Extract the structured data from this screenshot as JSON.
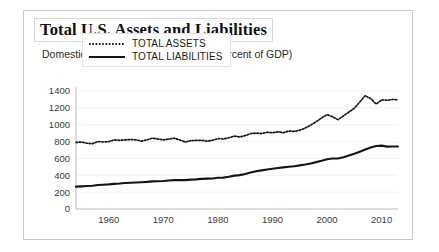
{
  "figure": {
    "title": "Total U.S. Assets and Liabilities",
    "subtitle": "Domestic Assets and Liabilities (as a Percent of GDP)",
    "border_color": "#c9c9c9",
    "background": "#ffffff"
  },
  "legend": {
    "position": "top-left-inside",
    "entries": [
      {
        "label": "TOTAL ASSETS",
        "style": "dotted",
        "color": "#141414"
      },
      {
        "label": "TOTAL LIABILITIES",
        "style": "solid",
        "color": "#141414"
      }
    ]
  },
  "chart_data": {
    "type": "line",
    "title": "Total U.S. Assets and Liabilities",
    "subtitle": "Domestic Assets and Liabilities (as a Percent of GDP)",
    "xlabel": "",
    "ylabel": "",
    "xlim": [
      1954,
      2013
    ],
    "ylim": [
      0,
      1400
    ],
    "grid": true,
    "yticks": [
      0,
      200,
      400,
      600,
      800,
      1000,
      1200,
      1400
    ],
    "ytick_labels": [
      "0",
      "200",
      "400",
      "600",
      "800",
      "1000",
      "1200",
      "1400"
    ],
    "xticks": [
      1960,
      1970,
      1980,
      1990,
      2000,
      2010
    ],
    "xtick_labels": [
      "1960",
      "1970",
      "1980",
      "1990",
      "2000",
      "2010"
    ],
    "legend_position": "upper left",
    "x": [
      1954,
      1955,
      1956,
      1957,
      1958,
      1959,
      1960,
      1961,
      1962,
      1963,
      1964,
      1965,
      1966,
      1967,
      1968,
      1969,
      1970,
      1971,
      1972,
      1973,
      1974,
      1975,
      1976,
      1977,
      1978,
      1979,
      1980,
      1981,
      1982,
      1983,
      1984,
      1985,
      1986,
      1987,
      1988,
      1989,
      1990,
      1991,
      1992,
      1993,
      1994,
      1995,
      1996,
      1997,
      1998,
      1999,
      2000,
      2001,
      2002,
      2003,
      2004,
      2005,
      2006,
      2007,
      2008,
      2009,
      2010,
      2011,
      2012,
      2013
    ],
    "series": [
      {
        "name": "TOTAL ASSETS",
        "style": "dotted",
        "color": "#141414",
        "values": [
          790,
          795,
          780,
          775,
          800,
          795,
          800,
          820,
          815,
          820,
          825,
          820,
          805,
          820,
          840,
          830,
          820,
          830,
          840,
          820,
          795,
          810,
          815,
          815,
          805,
          815,
          835,
          830,
          845,
          865,
          855,
          870,
          895,
          900,
          895,
          910,
          905,
          915,
          905,
          925,
          920,
          935,
          960,
          995,
          1035,
          1080,
          1120,
          1095,
          1060,
          1105,
          1150,
          1195,
          1270,
          1345,
          1310,
          1245,
          1295,
          1290,
          1300,
          1295
        ]
      },
      {
        "name": "TOTAL LIABILITIES",
        "style": "solid",
        "color": "#141414",
        "values": [
          265,
          268,
          272,
          275,
          285,
          288,
          292,
          298,
          302,
          308,
          312,
          315,
          318,
          322,
          328,
          330,
          332,
          338,
          342,
          344,
          342,
          348,
          352,
          358,
          360,
          362,
          370,
          372,
          382,
          396,
          402,
          415,
          432,
          448,
          458,
          468,
          478,
          486,
          494,
          502,
          508,
          518,
          528,
          540,
          556,
          572,
          590,
          600,
          600,
          615,
          635,
          655,
          680,
          705,
          730,
          748,
          752,
          740,
          742,
          742
        ]
      }
    ]
  }
}
